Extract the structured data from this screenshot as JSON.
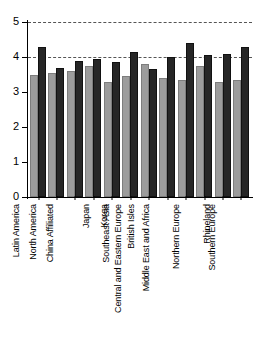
{
  "chart_data": {
    "type": "bar",
    "title": "",
    "xlabel": "",
    "ylabel": "",
    "ylim": [
      0,
      5
    ],
    "yticks": [
      0,
      1,
      2,
      3,
      4,
      5
    ],
    "ytick_labels": [
      "0",
      "1",
      "2",
      "3",
      "4",
      "5"
    ],
    "grid": false,
    "legend": null,
    "reference_lines": [
      {
        "y": 5,
        "style": "dashed"
      },
      {
        "y": 4,
        "style": "dashed"
      }
    ],
    "categories": [
      "Latin America",
      "North America",
      "China Affiliated",
      "Japan",
      "Korea",
      "Southeast Asia",
      "British Isles",
      "Central and Eastern Europe",
      "Middle East and Africa",
      "Northern Europe",
      "Rhineland",
      "Southern Europe"
    ],
    "series": [
      {
        "name": "light",
        "color": "#9c9c9c",
        "values": [
          3.5,
          3.55,
          3.6,
          3.75,
          3.3,
          3.45,
          3.8,
          3.4,
          3.35,
          3.75,
          3.3,
          3.35
        ]
      },
      {
        "name": "dark",
        "color": "#262626",
        "values": [
          4.3,
          3.7,
          3.9,
          3.95,
          3.85,
          4.15,
          3.65,
          4.0,
          4.4,
          4.05,
          4.1,
          4.3
        ]
      }
    ]
  }
}
